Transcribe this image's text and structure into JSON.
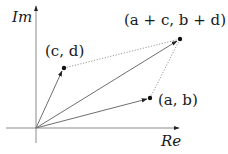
{
  "diagram": {
    "type": "complex-plane-vector-addition",
    "axes": {
      "x_label": "Re",
      "y_label": "Im",
      "origin": [
        36,
        128
      ]
    },
    "points": [
      {
        "id": "p1",
        "label_open": "(",
        "label_parts": [
          "a",
          ", ",
          "b"
        ],
        "label_close": ")",
        "label": "(a, b)",
        "pos": [
          150,
          98
        ]
      },
      {
        "id": "p2",
        "label": "(c, d)",
        "pos": [
          64,
          68
        ]
      },
      {
        "id": "p3",
        "label": "(a + c, b + d)",
        "pos": [
          180,
          39
        ]
      }
    ],
    "labels": {
      "im": "Im",
      "re": "Re",
      "ab": "(a, b)",
      "cd": "(c, d)",
      "sum": "(a + c, b + d)"
    },
    "colors": {
      "axis": "#8a8a8a",
      "vector": "#6f6f6f",
      "dotted": "#9a9a9a",
      "point": "#111111",
      "text": "#1a1a1a"
    }
  }
}
